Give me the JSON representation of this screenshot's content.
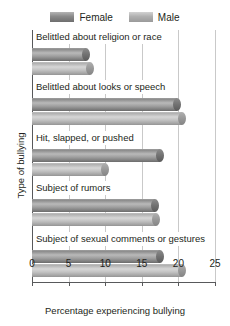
{
  "chart_data": {
    "type": "bar",
    "orientation": "horizontal",
    "title": "",
    "xlabel": "Percentage experiencing bullying",
    "ylabel": "Type of bullying",
    "xlim": [
      0,
      25
    ],
    "xticks": [
      0,
      5,
      10,
      15,
      20,
      25
    ],
    "grid": true,
    "legend_position": "top-center",
    "categories": [
      "Belittled about religion or race",
      "Belittled about looks or speech",
      "Hit, slapped, or pushed",
      "Subject of rumors",
      "Subject of sexual comments or gestures"
    ],
    "series": [
      {
        "name": "Female",
        "color": "#8a8a8a",
        "values": [
          7.4,
          19.8,
          17.5,
          16.8,
          17.5
        ]
      },
      {
        "name": "Male",
        "color": "#b4b4b4",
        "values": [
          7.9,
          20.5,
          10.0,
          17.0,
          20.5
        ]
      }
    ]
  },
  "legend": {
    "items": [
      {
        "label": "Female",
        "swatch": "female-swatch"
      },
      {
        "label": "Male",
        "swatch": "male-swatch"
      }
    ]
  }
}
